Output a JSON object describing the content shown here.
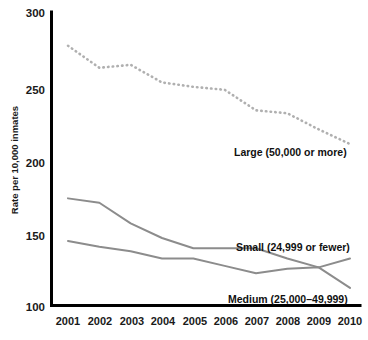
{
  "chart_data": {
    "type": "line",
    "title": "",
    "subtitle": "",
    "xlabel": "",
    "ylabel": "Rate per 10,000 inmates",
    "categories": [
      "2001",
      "2002",
      "2003",
      "2004",
      "2005",
      "2006",
      "2007",
      "2008",
      "2009",
      "2010"
    ],
    "x": [
      2001,
      2002,
      2003,
      2004,
      2005,
      2006,
      2007,
      2008,
      2009,
      2010
    ],
    "xlim": [
      2001,
      2010
    ],
    "ylim": [
      100,
      300
    ],
    "yticks": [
      100,
      150,
      200,
      250,
      300
    ],
    "ytick_labels": [
      "100",
      "150",
      "200",
      "250",
      "300"
    ],
    "grid": false,
    "legend_position": "inline-annotations",
    "series": [
      {
        "name": "Large (50,000 or more)",
        "style": "dotted",
        "color": "#b0b0b0",
        "values": [
          277,
          262,
          264,
          252,
          249,
          247,
          233,
          231,
          220,
          210
        ]
      },
      {
        "name": "Small (24,999 or fewer)",
        "style": "solid",
        "color": "#8c8c8c",
        "values": [
          173,
          170,
          156,
          146,
          139,
          139,
          139,
          132,
          126,
          132
        ]
      },
      {
        "name": "Medium (25,000-49,999)",
        "style": "solid",
        "color": "#8c8c8c",
        "values": [
          144,
          140,
          137,
          132,
          132,
          127,
          122,
          125,
          126,
          112
        ]
      }
    ],
    "annotations": [
      {
        "text": "Large (50,000 or more)",
        "x_px": 234,
        "y_px": 152
      },
      {
        "text": "Small (24,999 or fewer)",
        "x_px": 236,
        "y_px": 247
      },
      {
        "text": "Medium (25,000–49,999)",
        "x_px": 228,
        "y_px": 300
      }
    ]
  },
  "axes": {
    "y_title": "Rate per 10,000 inmates",
    "y_tick_0": "300",
    "y_tick_1": "250",
    "y_tick_2": "200",
    "y_tick_3": "150",
    "y_tick_4": "100",
    "x_tick_0": "2001",
    "x_tick_1": "2002",
    "x_tick_2": "2003",
    "x_tick_3": "2004",
    "x_tick_4": "2005",
    "x_tick_5": "2006",
    "x_tick_6": "2007",
    "x_tick_7": "2008",
    "x_tick_8": "2009",
    "x_tick_9": "2010"
  },
  "labels": {
    "large": "Large (50,000 or more)",
    "small": "Small (24,999 or fewer)",
    "medium": "Medium (25,000–49,999)"
  },
  "colors": {
    "axis": "#000000",
    "solid_line": "#8c8c8c",
    "dotted_line": "#b0b0b0",
    "text": "#1a1a1a",
    "background": "#ffffff"
  }
}
